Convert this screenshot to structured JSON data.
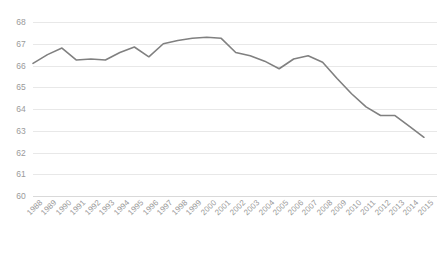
{
  "chart_data": {
    "type": "line",
    "title": "",
    "subtitle": "",
    "xlabel": "",
    "ylabel": "",
    "grid": true,
    "legend": false,
    "legend_position": "none",
    "line_color": "#808080",
    "gridline_color": "#e8e8e8",
    "tick_label_color": "#9a9a9a",
    "background_color": "#ffffff",
    "ylim": [
      60,
      68
    ],
    "yticks": [
      60,
      61,
      62,
      63,
      64,
      65,
      66,
      67,
      68
    ],
    "ytick_labels": [
      "60",
      "61",
      "62",
      "63",
      "64",
      "65",
      "66",
      "67",
      "68"
    ],
    "categories": [
      "1988",
      "1989",
      "1990",
      "1991",
      "1992",
      "1993",
      "1994",
      "1995",
      "1996",
      "1997",
      "1998",
      "1999",
      "2000",
      "2001",
      "2002",
      "2003",
      "2004",
      "2005",
      "2006",
      "2007",
      "2008",
      "2009",
      "2010",
      "2011",
      "2012",
      "2013",
      "2014",
      "2015"
    ],
    "values": [
      66.1,
      66.5,
      66.8,
      66.25,
      66.3,
      66.25,
      66.6,
      66.85,
      66.4,
      67.0,
      67.15,
      67.25,
      67.3,
      67.25,
      66.6,
      66.45,
      66.2,
      65.85,
      66.3,
      66.45,
      66.15,
      65.4,
      64.7,
      64.1,
      63.7,
      63.7,
      63.2,
      62.7
    ],
    "series": [
      {
        "name": "series-1",
        "values": [
          66.1,
          66.5,
          66.8,
          66.25,
          66.3,
          66.25,
          66.6,
          66.85,
          66.4,
          67.0,
          67.15,
          67.25,
          67.3,
          67.25,
          66.6,
          66.45,
          66.2,
          65.85,
          66.3,
          66.45,
          66.15,
          65.4,
          64.7,
          64.1,
          63.7,
          63.7,
          63.2,
          62.7
        ]
      }
    ]
  }
}
